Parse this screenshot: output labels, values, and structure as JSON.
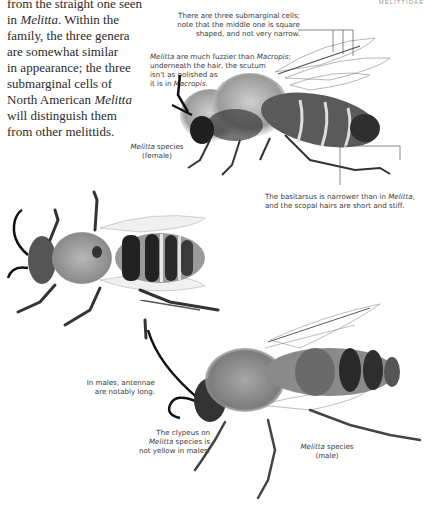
{
  "running_head": "MELITTIDAE",
  "body_text": {
    "lines": [
      [
        {
          "t": "from the straight one seen"
        }
      ],
      [
        {
          "t": "in "
        },
        {
          "t": "Melitta",
          "i": true
        },
        {
          "t": ". Within the"
        }
      ],
      [
        {
          "t": "family, the three genera"
        }
      ],
      [
        {
          "t": "are somewhat similar"
        }
      ],
      [
        {
          "t": "in appearance; the three"
        }
      ],
      [
        {
          "t": "submarginal cells of"
        }
      ],
      [
        {
          "t": "North American "
        },
        {
          "t": "Melitta",
          "i": true
        }
      ],
      [
        {
          "t": "will distinguish them"
        }
      ],
      [
        {
          "t": "from other melittids."
        }
      ]
    ]
  },
  "annotations": {
    "submarginal": {
      "lines": [
        "There are three submarginal cells;",
        "note that the middle one is square",
        "shaped, and not very narrow."
      ]
    },
    "fuzzier": {
      "lines": [
        [
          {
            "t": "Melitta",
            "i": true
          },
          {
            "t": " are much fuzzier than "
          },
          {
            "t": "Macropis",
            "i": true
          },
          {
            "t": ";"
          }
        ],
        [
          {
            "t": "underneath the hair, the scutum"
          }
        ],
        [
          {
            "t": "isn't as polished as"
          }
        ],
        [
          {
            "t": "it is in "
          },
          {
            "t": "Macropis",
            "i": true
          },
          {
            "t": "."
          }
        ]
      ]
    },
    "female_label": {
      "genus": "Melitta",
      "species_word": " species",
      "sex": "(female)"
    },
    "basitarsus": {
      "lines": [
        [
          {
            "t": "The basitarsus is narrower than in "
          },
          {
            "t": "Melitta",
            "i": true
          },
          {
            "t": ","
          }
        ],
        [
          {
            "t": "and the scopal hairs are short and stiff."
          }
        ]
      ]
    },
    "antennae": {
      "lines": [
        "In males, antennae",
        "are notably long."
      ]
    },
    "clypeus": {
      "lines": [
        [
          {
            "t": "The clypeus on"
          }
        ],
        [
          {
            "t": "Melitta",
            "i": true
          },
          {
            "t": " species is"
          }
        ],
        [
          {
            "t": "not yellow in males."
          }
        ]
      ]
    },
    "male_label": {
      "genus": "Melitta",
      "species_word": " species",
      "sex": "(male)"
    }
  },
  "figures": [
    {
      "name": "female-bee-side-view",
      "description": "Melitta species (female), lateral view"
    },
    {
      "name": "bee-dorsal-view",
      "description": "Bee, dorsal view"
    },
    {
      "name": "male-bee-side-view",
      "description": "Melitta species (male), lateral view"
    }
  ],
  "colors": {
    "text": "#2a2a2a",
    "caption": "#3a3a3a",
    "leader_line": "#555555"
  }
}
